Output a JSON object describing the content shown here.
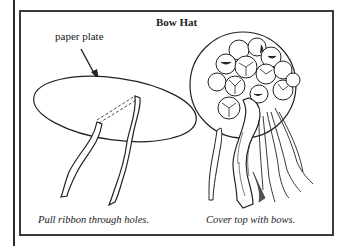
{
  "figure": {
    "title": "Bow Hat",
    "left_panel": {
      "callout_label": "paper plate",
      "caption": "Pull ribbon through holes."
    },
    "right_panel": {
      "caption": "Cover top with bows."
    }
  },
  "colors": {
    "ink": "#222222",
    "frame": "#3a3a3a",
    "background": "#ffffff"
  }
}
